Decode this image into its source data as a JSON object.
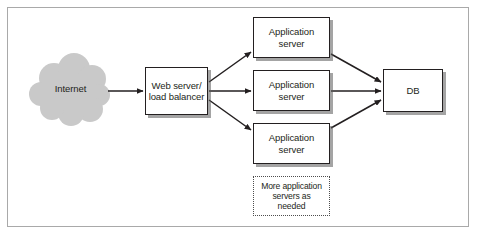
{
  "diagram": {
    "background_color": "#ffffff",
    "frame_color": "#a9a9a9",
    "node_border_color": "#231f20",
    "cloud_fill_color": "#c9c9c9",
    "shadow_color": "#5a5a5a",
    "arrow_color": "#231f20"
  },
  "nodes": {
    "internet": {
      "label": "Internet",
      "shape": "cloud"
    },
    "web_server": {
      "label": "Web server/\nload balancer",
      "shape": "box"
    },
    "app_server_1": {
      "label": "Application\nserver",
      "shape": "box"
    },
    "app_server_2": {
      "label": "Application\nserver",
      "shape": "box"
    },
    "app_server_3": {
      "label": "Application\nserver",
      "shape": "box"
    },
    "more_servers": {
      "label": "More application\nservers as\nneeded",
      "shape": "dotted-box"
    },
    "db": {
      "label": "DB",
      "shape": "box"
    }
  },
  "edges": [
    {
      "from": "internet",
      "to": "web_server",
      "style": "arrow"
    },
    {
      "from": "web_server",
      "to": "app_server_1",
      "style": "arrow"
    },
    {
      "from": "web_server",
      "to": "app_server_2",
      "style": "arrow"
    },
    {
      "from": "web_server",
      "to": "app_server_3",
      "style": "arrow"
    },
    {
      "from": "app_server_1",
      "to": "db",
      "style": "arrow"
    },
    {
      "from": "app_server_2",
      "to": "db",
      "style": "arrow"
    },
    {
      "from": "app_server_3",
      "to": "db",
      "style": "arrow"
    }
  ]
}
